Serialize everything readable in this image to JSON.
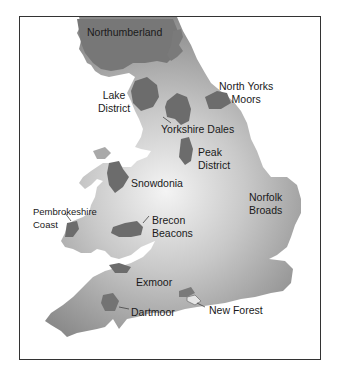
{
  "map": {
    "title": "National Parks of England and Wales",
    "colors": {
      "land_light": "#f2f2f2",
      "land_dark": "#8e8e8e",
      "park": "#6f6f6f",
      "border": "#333333",
      "water": "#ffffff"
    },
    "parks": [
      {
        "name": "Northumberland",
        "line1": "Northumberland",
        "line2": ""
      },
      {
        "name": "Lake District",
        "line1": "Lake",
        "line2": "District"
      },
      {
        "name": "North Yorks Moors",
        "line1": "North Yorks",
        "line2": "Moors"
      },
      {
        "name": "Yorkshire Dales",
        "line1": "Yorkshire Dales",
        "line2": ""
      },
      {
        "name": "Peak District",
        "line1": "Peak",
        "line2": "District"
      },
      {
        "name": "Snowdonia",
        "line1": "Snowdonia",
        "line2": ""
      },
      {
        "name": "Pembrokeshire Coast",
        "line1": "Pembrokeshire",
        "line2": "Coast"
      },
      {
        "name": "Brecon Beacons",
        "line1": "Brecon",
        "line2": "Beacons"
      },
      {
        "name": "Norfolk Broads",
        "line1": "Norfolk",
        "line2": "Broads"
      },
      {
        "name": "Exmoor",
        "line1": "Exmoor",
        "line2": ""
      },
      {
        "name": "Dartmoor",
        "line1": "Dartmoor",
        "line2": ""
      },
      {
        "name": "New Forest",
        "line1": "New Forest",
        "line2": ""
      }
    ]
  }
}
